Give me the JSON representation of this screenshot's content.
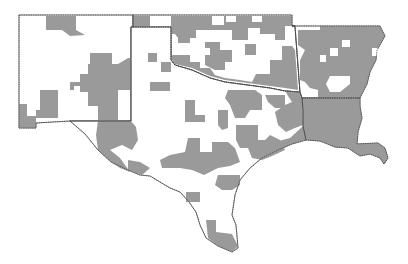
{
  "map": {
    "type": "choropleth",
    "region": "South-central United States (NM, TX, OK, AR, LA)",
    "colors": {
      "background": "#ffffff",
      "unshaded": "#ffffff",
      "shaded": "#9a9a9a",
      "outline": "#555555"
    },
    "states": [
      {
        "name": "New Mexico",
        "points": "19,15 133,15 133,27 131,27 131,121 70,121 36,123 36,128 19,128"
      },
      {
        "name": "Oklahoma",
        "points": "133,15 292,15 292,26 295,26 300,92 285,91 270,88 255,86 240,84 225,82 210,78 192,70 175,65 171,60 171,27 133,27"
      },
      {
        "name": "Arkansas",
        "points": "292,26 380,26 385,36 377,50 376,60 370,72 367,84 360,98 302,98 300,92 295,26"
      },
      {
        "name": "Louisiana",
        "points": "302,98 360,98 360,106 362,118 358,132 357,144 378,143 385,148 388,158 384,164 380,158 370,154 360,156 348,148 335,147 320,141 306,140 303,126 303,110"
      },
      {
        "name": "Texas",
        "points": "133,27 171,27 171,60 175,65 192,70 210,78 225,82 240,84 255,86 270,88 285,91 300,92 302,98 303,110 303,126 306,140 292,144 278,150 262,158 250,168 240,180 235,195 232,215 236,225 238,248 232,252 218,246 206,238 200,225 196,212 189,202 180,192 170,188 160,182 150,176 140,175 128,170 111,162 98,150 85,134 70,121 131,121 131,27"
      }
    ],
    "shaded_regions": [
      {
        "area": "NM north",
        "points": "46,16 76,16 76,30 85,35 70,36 62,30 46,30"
      },
      {
        "area": "NM central",
        "points": "90,53 112,53 112,64 118,64 128,58 131,58 131,90 118,90 118,120 98,120 98,106 88,106 88,92 80,92 80,86 74,86 74,90 58,90 58,118 36,118 36,128 19,128 19,104 27,104 27,116 36,116 36,110 40,110 40,90 70,90 70,82 80,82 80,74 88,74 88,64 90,64"
      },
      {
        "area": "NM/TX border",
        "points": "98,121 131,121 136,127 138,140 132,150 122,145 110,150 120,158 130,172 120,168 111,162 98,150 96,135"
      },
      {
        "area": "OK panhandle",
        "points": "133,16 150,16 150,27 133,27"
      },
      {
        "area": "OK north",
        "points": "171,16 212,16 212,25 224,25 224,16 292,16 292,26 285,26 285,40 275,40 275,34 260,34 260,28 248,28 248,40 232,40 232,30 222,30 210,30 196,30 196,38 188,38 178,38 175,34 171,34"
      },
      {
        "area": "TX panhandle 1",
        "points": "178,35 190,35 190,43 178,43"
      },
      {
        "area": "TX panhandle 2",
        "points": "148,53 157,53 157,62 148,62"
      },
      {
        "area": "TX panhandle 3",
        "points": "161,62 171,62 171,72 161,72"
      },
      {
        "area": "TX panhandle 4",
        "points": "150,82 170,82 170,91 150,91"
      },
      {
        "area": "OK central",
        "points": "205,42 220,42 220,50 232,50 232,62 225,62 225,70 215,70 205,65 205,55 210,55 210,48 205,48"
      },
      {
        "area": "OK south",
        "points": "172,55 190,55 190,62 200,62 200,68 210,68 215,75 225,78 240,80 252,82 256,74 270,74 270,60 282,60 282,46 292,46 295,50 298,90 285,88 270,86 255,84 240,82 225,80 210,76 192,68 175,64 172,60"
      },
      {
        "area": "OK east cluster",
        "points": "245,44 256,44 256,55 245,55"
      },
      {
        "area": "TX north central 1",
        "points": "185,100 195,100 195,115 205,115 205,122 185,122"
      },
      {
        "area": "TX north central 2",
        "points": "228,90 255,90 262,95 262,110 250,110 245,118 235,118 230,105 225,98"
      },
      {
        "area": "TX east 1",
        "points": "265,95 285,95 285,108 275,108 268,102"
      },
      {
        "area": "TX east 2",
        "points": "285,90 300,92 302,98 303,125 295,128 286,132 278,125 275,112 285,105 292,102 288,96"
      },
      {
        "area": "TX central 1",
        "points": "218,110 228,110 228,128 222,130 218,125"
      },
      {
        "area": "TX central 2",
        "points": "236,125 258,125 258,140 265,140 270,135 280,140 285,150 272,156 262,160 252,158 248,148 240,148 236,140"
      },
      {
        "area": "TX central 3",
        "points": "188,138 200,138 200,152 212,152 212,142 228,142 235,148 240,162 230,166 218,168 204,175 192,170 180,168 162,168 160,160 170,155 185,152"
      },
      {
        "area": "TX southeast coast",
        "points": "255,148 262,148 275,142 290,138 303,126 306,140 292,144 278,150 262,158 254,158"
      },
      {
        "area": "TX south 1",
        "points": "218,175 240,175 240,185 232,190 222,190 215,185"
      },
      {
        "area": "TX south 2",
        "points": "186,192 200,192 200,202 186,202"
      },
      {
        "area": "TX south tip",
        "points": "206,220 216,220 216,232 232,234 238,246 232,252 218,246 208,238"
      },
      {
        "area": "TX southwest",
        "points": "128,160 140,162 150,168 142,175 128,170"
      },
      {
        "area": "AR",
        "points": "298,30 320,30 320,26 380,26 385,36 377,50 376,60 370,72 367,84 360,98 318,98 318,90 310,88 305,82 300,80 300,60 305,50 298,45"
      },
      {
        "area": "LA",
        "points": "302,98 360,98 360,106 362,118 358,132 357,144 378,143 385,148 388,158 384,164 380,158 370,154 360,156 348,148 335,147 320,141 306,140 303,126 303,110"
      }
    ],
    "unshaded_holes": [
      {
        "area": "AR hole 1",
        "points": "330,48 338,48 338,56 330,56"
      },
      {
        "area": "AR hole 2",
        "points": "342,40 350,40 350,47 342,47"
      },
      {
        "area": "AR hole 3",
        "points": "320,55 326,55 326,62 320,62"
      },
      {
        "area": "AR hole 4",
        "points": "330,76 350,76 350,84 340,92 330,92 326,84"
      },
      {
        "area": "AR hole 5",
        "points": "372,48 378,48 378,56 372,56"
      },
      {
        "area": "OK hole 1",
        "points": "226,16 236,16 236,22 226,22"
      },
      {
        "area": "OK hole 2",
        "points": "252,16 262,16 262,22 252,22"
      }
    ]
  }
}
